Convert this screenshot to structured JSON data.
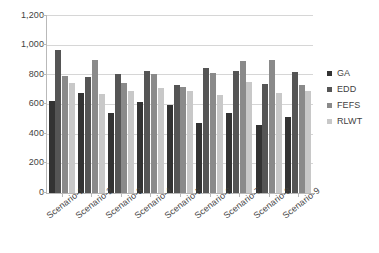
{
  "chart_data": {
    "type": "bar",
    "title": "",
    "subtitle": "",
    "xlabel": "",
    "ylabel": "",
    "ylim": [
      0,
      1200
    ],
    "ytick_labels": [
      "1,200",
      "1,000",
      "800",
      "600",
      "400",
      "200",
      "0"
    ],
    "ytick_values": [
      1200,
      1000,
      800,
      600,
      400,
      200,
      0
    ],
    "grid": "horizontal",
    "legend_position": "right",
    "categories": [
      "Scenario-1",
      "Scenario-2",
      "Scenario-3",
      "Scenario-4",
      "Scenario-5",
      "Scenario-6",
      "Scenario-7",
      "Scenario-8",
      "Scenario-9"
    ],
    "series": [
      {
        "name": "GA",
        "color": "#333333",
        "values": [
          620,
          675,
          540,
          615,
          590,
          475,
          540,
          460,
          510
        ]
      },
      {
        "name": "EDD",
        "color": "#555555",
        "values": [
          965,
          785,
          800,
          825,
          730,
          845,
          820,
          735,
          815
        ]
      },
      {
        "name": "FEFS",
        "color": "#8a8a8a",
        "values": [
          790,
          900,
          745,
          800,
          715,
          810,
          890,
          895,
          725
        ]
      },
      {
        "name": "RLWT",
        "color": "#c8c8c8",
        "values": [
          745,
          670,
          685,
          710,
          690,
          660,
          750,
          675,
          690
        ]
      }
    ]
  },
  "colors": {
    "background": "#ffffff",
    "grid": "#d6d6d6",
    "axis": "#b9b9b9",
    "text": "#3f3f3f"
  }
}
